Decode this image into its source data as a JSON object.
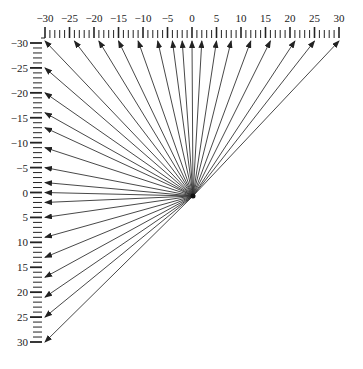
{
  "diagram": {
    "type": "radial-arrow-fan",
    "origin": {
      "x": 0,
      "y": 0
    },
    "colors": {
      "line": "#333333",
      "ruler": "#222222",
      "text": "#222222",
      "background": "#ffffff"
    },
    "top_ruler": {
      "labels": [
        "-30",
        "-25",
        "-20",
        "-15",
        "-10",
        "-5",
        "0",
        "5",
        "10",
        "15",
        "20",
        "25",
        "30"
      ],
      "values": [
        -30,
        -25,
        -20,
        -15,
        -10,
        -5,
        0,
        5,
        10,
        15,
        20,
        25,
        30
      ],
      "min": -30,
      "max": 30,
      "minor_step": 1,
      "major_step": 5
    },
    "left_ruler": {
      "labels": [
        "-30",
        "-25",
        "-20",
        "-15",
        "-10",
        "-5",
        "0",
        "5",
        "10",
        "15",
        "20",
        "25",
        "30"
      ],
      "values": [
        -30,
        -25,
        -20,
        -15,
        -10,
        -5,
        0,
        5,
        10,
        15,
        20,
        25,
        30
      ],
      "min": -30,
      "max": 30,
      "minor_step": 1,
      "major_step": 5
    },
    "arrows_to_top": [
      -30,
      -24,
      -19,
      -15,
      -11,
      -7,
      -4,
      -2,
      0,
      2,
      5,
      8,
      12,
      16,
      21,
      25,
      30
    ],
    "arrows_to_left": [
      -25,
      -20,
      -16,
      -13,
      -9,
      -5,
      -2,
      0,
      2,
      5,
      9,
      13,
      17,
      21,
      25,
      30
    ]
  }
}
